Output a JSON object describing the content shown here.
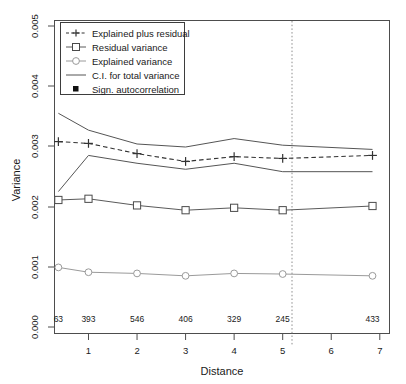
{
  "chart_data": {
    "type": "line",
    "title": "",
    "xlabel": "Distance",
    "ylabel": "Variance",
    "xlim": [
      0.3,
      7.2
    ],
    "ylim": [
      0.0,
      0.005
    ],
    "grid": false,
    "legend_position": "top-left",
    "x_ticks": [
      1,
      2,
      3,
      4,
      5,
      6,
      7
    ],
    "x_tick_labels": [
      "1",
      "2",
      "3",
      "4",
      "5",
      "6",
      "7"
    ],
    "y_ticks": [
      0.0,
      0.001,
      0.002,
      0.003,
      0.004,
      0.005
    ],
    "y_tick_labels": [
      "0.000",
      "0.001",
      "0.002",
      "0.003",
      "0.004",
      "0.005"
    ],
    "x": [
      0.38,
      1.0,
      2.0,
      3.0,
      4.0,
      5.0,
      6.85
    ],
    "sample_counts": [
      63,
      393,
      546,
      406,
      329,
      245,
      433
    ],
    "vertical_reference_line": {
      "x": 5.06,
      "style": "dotted"
    },
    "series": [
      {
        "name": "Explained plus residual",
        "key": "total",
        "marker": "plus",
        "linestyle": "dashed",
        "values": [
          0.00308,
          0.00305,
          0.00288,
          0.00275,
          0.00283,
          0.0028,
          0.00285
        ]
      },
      {
        "name": "Residual variance",
        "key": "residual",
        "marker": "square",
        "linestyle": "solid",
        "values": [
          0.00211,
          0.00213,
          0.00202,
          0.00194,
          0.00198,
          0.00194,
          0.00201
        ]
      },
      {
        "name": "Explained variance",
        "key": "explained",
        "marker": "circle",
        "linestyle": "solid",
        "values": [
          0.00099,
          0.00091,
          0.00089,
          0.00085,
          0.00089,
          0.00088,
          0.00085
        ]
      },
      {
        "name": "C.I. for total variance (upper)",
        "key": "ci_upper",
        "marker": "none",
        "linestyle": "solid",
        "values": [
          0.00355,
          0.00327,
          0.00304,
          0.00299,
          0.00313,
          0.00302,
          0.00295
        ]
      },
      {
        "name": "C.I. for total variance (lower)",
        "key": "ci_lower",
        "marker": "none",
        "linestyle": "solid",
        "values": [
          0.00225,
          0.00285,
          0.00272,
          0.00262,
          0.00272,
          0.00258,
          0.00258
        ]
      }
    ],
    "legend_entries": [
      {
        "label": "Explained plus residual",
        "marker": "plus",
        "linestyle": "dashed"
      },
      {
        "label": "Residual variance",
        "marker": "square",
        "linestyle": "solid"
      },
      {
        "label": "Explained variance",
        "marker": "circle",
        "linestyle": "solid"
      },
      {
        "label": "C.I. for total variance",
        "marker": "none",
        "linestyle": "solid"
      },
      {
        "label": "Sign. autocorrelation",
        "marker": "filled-square",
        "linestyle": "none"
      }
    ]
  }
}
